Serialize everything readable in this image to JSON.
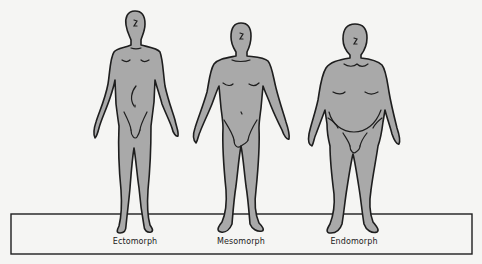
{
  "diagram": {
    "figures": [
      {
        "id": "ectomorph",
        "label": "Ectomorph",
        "label_x": 135
      },
      {
        "id": "mesomorph",
        "label": "Mesomorph",
        "label_x": 241
      },
      {
        "id": "endomorph",
        "label": "Endomorph",
        "label_x": 354
      }
    ],
    "colors": {
      "background": "#f5f5f3",
      "figure_fill": "#a9a9a9",
      "outline": "#1e1e1e"
    }
  }
}
